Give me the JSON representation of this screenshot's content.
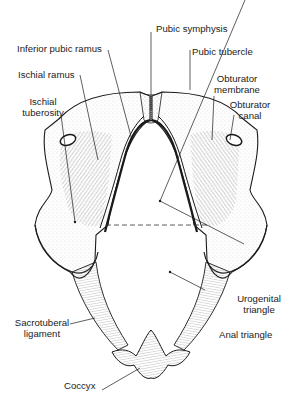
{
  "figure": {
    "colors": {
      "ink": "#1a1a1a",
      "background": "#ffffff",
      "hatch": "#555555"
    }
  },
  "labels": {
    "pubic_symphysis": "Pubic symphysis",
    "inferior_pubic_ramus": "Inferior pubic ramus",
    "pubic_tubercle": "Pubic tubercle",
    "ischial_ramus": "Ischial ramus",
    "obturator_membrane_1": "Obturator",
    "obturator_membrane_2": "membrane",
    "ischial_tuberosity_1": "Ischial",
    "ischial_tuberosity_2": "tuberosity",
    "obturator_canal_1": "Obturator",
    "obturator_canal_2": "canal",
    "urogenital_triangle_1": "Urogenital",
    "urogenital_triangle_2": "triangle",
    "sacrotuberal_ligament_1": "Sacrotuberal",
    "sacrotuberal_ligament_2": "ligament",
    "anal_triangle": "Anal triangle",
    "coccyx": "Coccyx"
  }
}
